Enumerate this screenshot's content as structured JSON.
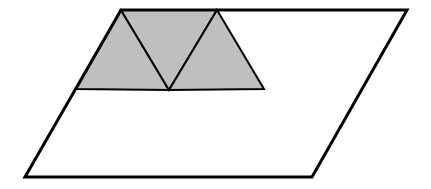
{
  "canvas": {
    "width": 431,
    "height": 189,
    "background": "#ffffff"
  },
  "colors": {
    "stroke": "#000000",
    "shade": "#bfbfbf"
  },
  "parallelogram": {
    "points": [
      [
        121,
        10
      ],
      [
        407,
        10
      ],
      [
        312,
        177
      ],
      [
        25,
        177
      ]
    ],
    "stroke_width": 3
  },
  "shaded_triangles": [
    {
      "name": "left-triangle",
      "points": [
        [
          121,
          10
        ],
        [
          169,
          90
        ],
        [
          76,
          89
        ]
      ]
    },
    {
      "name": "middle-triangle",
      "points": [
        [
          121,
          10
        ],
        [
          217,
          10
        ],
        [
          169,
          90
        ]
      ]
    },
    {
      "name": "right-triangle",
      "points": [
        [
          217,
          10
        ],
        [
          264,
          89
        ],
        [
          169,
          90
        ]
      ]
    }
  ],
  "inner_stroke_width": 2
}
